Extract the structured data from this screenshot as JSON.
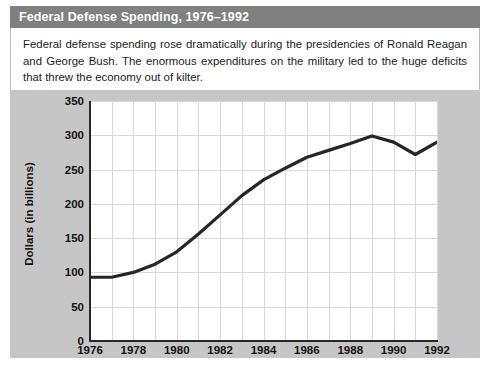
{
  "figure": {
    "title": "Federal Defense Spending, 1976–1992",
    "caption": "Federal defense spending rose dramatically during the presidencies of Ronald Reagan and George Bush. The enormous expenditures on the military led to the huge deficits that threw the economy out of kilter.",
    "title_bar_color": "#808080",
    "panel_color": "#c6c6c6",
    "plot_background": "#ffffff",
    "line_color": "#262626",
    "grid_color": "#d8d8d8"
  },
  "chart_data": {
    "type": "line",
    "title": "Federal Defense Spending, 1976–1992",
    "xlabel": "",
    "ylabel": "Dollars (in billions)",
    "xlim": [
      1976,
      1992
    ],
    "ylim": [
      0,
      350
    ],
    "grid": true,
    "legend": "none",
    "x_tick_labels": [
      "1976",
      "1978",
      "1980",
      "1982",
      "1984",
      "1986",
      "1988",
      "1990",
      "1992"
    ],
    "y_tick_labels": [
      "0",
      "50",
      "100",
      "150",
      "200",
      "250",
      "300",
      "350"
    ],
    "x_tick_values": [
      1976,
      1978,
      1980,
      1982,
      1984,
      1986,
      1988,
      1990,
      1992
    ],
    "y_tick_values": [
      0,
      50,
      100,
      150,
      200,
      250,
      300,
      350
    ],
    "x": [
      1976,
      1977,
      1978,
      1979,
      1980,
      1981,
      1982,
      1983,
      1984,
      1985,
      1986,
      1987,
      1988,
      1989,
      1990,
      1991,
      1992
    ],
    "values": [
      93,
      93,
      100,
      112,
      130,
      156,
      184,
      212,
      235,
      252,
      268,
      278,
      288,
      299,
      290,
      272,
      290
    ],
    "series": [
      {
        "name": "Federal defense spending",
        "values": [
          93,
          93,
          100,
          112,
          130,
          156,
          184,
          212,
          235,
          252,
          268,
          278,
          288,
          299,
          290,
          272,
          290
        ]
      }
    ]
  }
}
